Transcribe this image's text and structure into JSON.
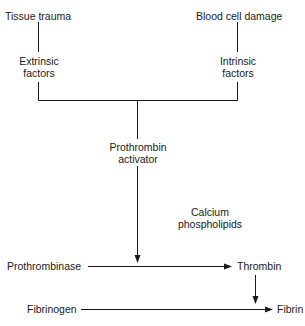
{
  "diagram": {
    "type": "flowchart",
    "nodes": {
      "tissue_trauma": "Tissue trauma",
      "blood_cell_damage": "Blood cell damage",
      "extrinsic_factors": [
        "Extrinsic",
        "factors"
      ],
      "intrinsic_factors": [
        "Intrinsic",
        "factors"
      ],
      "prothrombin_activator": [
        "Prothrombin",
        "activator"
      ],
      "calcium_phospholipids": [
        "Calcium",
        "phospholipids"
      ],
      "prothrombinase": "Prothrombinase",
      "thrombin": "Thrombin",
      "fibrinogen": "Fibrinogen",
      "fibrin": "Fibrin"
    },
    "edges": [
      {
        "from": "Tissue trauma",
        "to": "Extrinsic factors"
      },
      {
        "from": "Blood cell damage",
        "to": "Intrinsic factors"
      },
      {
        "from": "Extrinsic factors",
        "to": "Prothrombin activator"
      },
      {
        "from": "Intrinsic factors",
        "to": "Prothrombin activator"
      },
      {
        "from": "Prothrombin activator",
        "to": "Prothrombinase → Thrombin reaction"
      },
      {
        "from": "Prothrombinase",
        "to": "Thrombin"
      },
      {
        "from": "Thrombin",
        "to": "Fibrinogen → Fibrin reaction"
      },
      {
        "from": "Fibrinogen",
        "to": "Fibrin"
      }
    ],
    "line_color": "#1a1a1a"
  }
}
